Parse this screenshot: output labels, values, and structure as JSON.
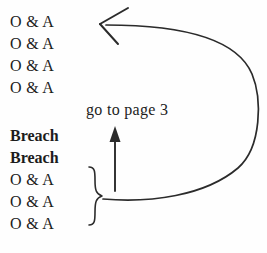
{
  "diagram": {
    "background_color": "#fefefe",
    "ink_color": "#2b2b2b",
    "items": [
      {
        "label": "O & A",
        "x": 10,
        "y": 14,
        "bold": false
      },
      {
        "label": "O & A",
        "x": 10,
        "y": 36,
        "bold": false
      },
      {
        "label": "O & A",
        "x": 10,
        "y": 58,
        "bold": false
      },
      {
        "label": "O & A",
        "x": 10,
        "y": 80,
        "bold": false
      },
      {
        "label": "Breach",
        "x": 10,
        "y": 128,
        "bold": true
      },
      {
        "label": "Breach",
        "x": 10,
        "y": 150,
        "bold": true
      },
      {
        "label": "O & A",
        "x": 10,
        "y": 172,
        "bold": false
      },
      {
        "label": "O & A",
        "x": 10,
        "y": 194,
        "bold": false
      },
      {
        "label": "O & A",
        "x": 10,
        "y": 216,
        "bold": false
      }
    ],
    "annotation": {
      "text": "go to page 3",
      "x": 86,
      "y": 102
    },
    "arrows": {
      "loop_arrow": {
        "name": "loop-back-arrow",
        "description": "curved arrow looping from the brace back up to the top group",
        "head_direction": "left",
        "head_style": "open-v"
      },
      "up_arrow": {
        "name": "go-to-page-arrow",
        "description": "straight vertical arrow pointing up under the go to page 3 label",
        "head_direction": "up",
        "head_style": "solid-triangle"
      }
    },
    "brace": {
      "name": "group-brace",
      "orientation": "right-pointing",
      "spans_items": 3
    }
  }
}
